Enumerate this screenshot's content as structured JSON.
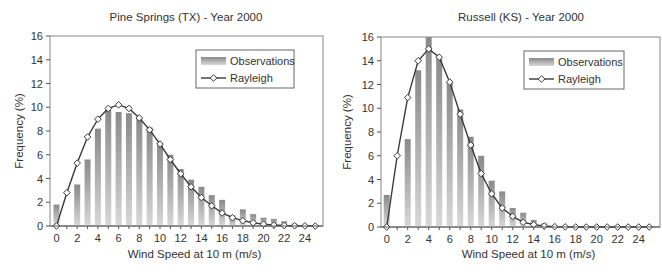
{
  "chart_data": [
    {
      "type": "bar",
      "title": "Pine Springs (TX) - Year 2000",
      "xlabel": "Wind Speed at 10 m (m/s)",
      "ylabel": "Frequency (%)",
      "ylim": [
        0,
        16
      ],
      "xlim": [
        0,
        25
      ],
      "yticks": [
        0,
        2,
        4,
        6,
        8,
        10,
        12,
        14,
        16
      ],
      "xticks": [
        0,
        2,
        4,
        6,
        8,
        10,
        12,
        14,
        16,
        18,
        20,
        22,
        24
      ],
      "grid": false,
      "legend_position": "upper right",
      "x": [
        0,
        1,
        2,
        3,
        4,
        5,
        6,
        7,
        8,
        9,
        10,
        11,
        12,
        13,
        14,
        15,
        16,
        17,
        18,
        19,
        20,
        21,
        22,
        23,
        24,
        25
      ],
      "series": [
        {
          "name": "Observations",
          "type": "bar",
          "values": [
            1.8,
            0,
            3.5,
            5.6,
            8.2,
            9.8,
            9.6,
            9.5,
            9.0,
            8.3,
            7.0,
            6.0,
            4.8,
            3.9,
            3.3,
            2.6,
            2.2,
            0.9,
            1.4,
            1.0,
            0.7,
            0.6,
            0.4,
            0.2,
            0.1,
            0
          ]
        },
        {
          "name": "Rayleigh",
          "type": "line",
          "values": [
            0,
            2.8,
            5.3,
            7.5,
            9.0,
            9.9,
            10.2,
            9.9,
            9.1,
            8.1,
            6.9,
            5.6,
            4.4,
            3.3,
            2.4,
            1.7,
            1.1,
            0.7,
            0.45,
            0.27,
            0.15,
            0.08,
            0.04,
            0.02,
            0.01,
            0
          ]
        }
      ]
    },
    {
      "type": "bar",
      "title": "Russell (KS) - Year 2000",
      "xlabel": "Wind Speed at 10 m (m/s)",
      "ylabel": "Frequency (%)",
      "ylim": [
        0,
        16
      ],
      "xlim": [
        0,
        25
      ],
      "yticks": [
        0,
        2,
        4,
        6,
        8,
        10,
        12,
        14,
        16
      ],
      "xticks": [
        0,
        2,
        4,
        6,
        8,
        10,
        12,
        14,
        16,
        18,
        20,
        22,
        24
      ],
      "grid": false,
      "legend_position": "upper right",
      "x": [
        0,
        1,
        2,
        3,
        4,
        5,
        6,
        7,
        8,
        9,
        10,
        11,
        12,
        13,
        14,
        15,
        16,
        17,
        18,
        19,
        20,
        21,
        22,
        23,
        24,
        25
      ],
      "series": [
        {
          "name": "Observations",
          "type": "bar",
          "values": [
            2.7,
            0,
            7.4,
            13.2,
            16.0,
            14.3,
            12.2,
            9.9,
            7.6,
            6.0,
            3.9,
            3.0,
            1.6,
            1.2,
            0.6,
            0.3,
            0.1,
            0.05,
            0,
            0,
            0,
            0,
            0,
            0,
            0,
            0
          ]
        },
        {
          "name": "Rayleigh",
          "type": "line",
          "values": [
            0,
            6.0,
            10.9,
            14.0,
            15.0,
            14.3,
            12.2,
            9.5,
            6.9,
            4.5,
            2.8,
            1.6,
            0.9,
            0.4,
            0.2,
            0.08,
            0.03,
            0.01,
            0,
            0,
            0,
            0,
            0,
            0,
            0,
            0
          ]
        }
      ]
    }
  ],
  "legend": {
    "observations_label": "Observations",
    "rayleigh_label": "Rayleigh"
  },
  "colors": {
    "bar_top": "#8a8a8a",
    "bar_bottom": "#d8d8d8",
    "line": "#3a3a3a",
    "frame": "#888888"
  }
}
